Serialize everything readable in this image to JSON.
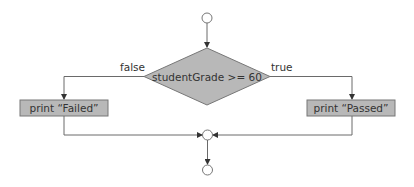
{
  "diagram": {
    "type": "flowchart",
    "colors": {
      "fill": "#b8b8b8",
      "stroke": "#777777",
      "line": "#6a6a6a",
      "text": "#333333"
    },
    "nodes": {
      "start": {
        "kind": "initial-circle"
      },
      "decision": {
        "kind": "diamond",
        "label": "studentGrade >= 60"
      },
      "failed": {
        "kind": "action",
        "label": "print “Failed”"
      },
      "passed": {
        "kind": "action",
        "label": "print “Passed”"
      },
      "merge": {
        "kind": "merge-circle"
      },
      "end": {
        "kind": "final-circle"
      }
    },
    "edges": {
      "false_label": "false",
      "true_label": "true"
    }
  }
}
